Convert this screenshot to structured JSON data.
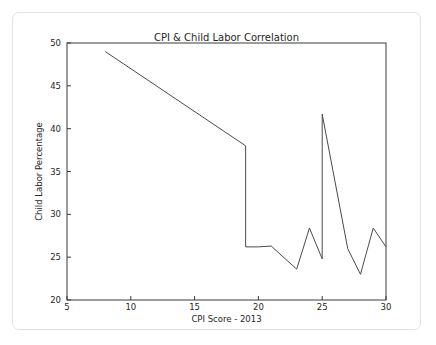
{
  "chart_data": {
    "type": "line",
    "title": "CPI & Child Labor Correlation",
    "xlabel": "CPI Score - 2013",
    "ylabel": "Child Labor Percentage",
    "xlim": [
      5,
      30
    ],
    "ylim": [
      20,
      50
    ],
    "xticks": [
      5,
      10,
      15,
      20,
      25,
      30
    ],
    "yticks": [
      20,
      25,
      30,
      35,
      40,
      45,
      50
    ],
    "xtick_labels": [
      "5",
      "10",
      "15",
      "20",
      "25",
      "30"
    ],
    "ytick_labels": [
      "20",
      "25",
      "30",
      "35",
      "40",
      "45",
      "50"
    ],
    "grid": false,
    "legend": null,
    "line_color": "#4b4b4b",
    "series": [
      {
        "name": "Child Labor Percentage",
        "x": [
          8,
          19,
          19,
          20,
          21,
          23,
          24,
          25,
          25,
          27,
          28,
          29,
          30
        ],
        "y": [
          49,
          38,
          26.2,
          26.2,
          26.3,
          23.6,
          28.4,
          24.8,
          41.7,
          26.0,
          23.0,
          28.4,
          26.2
        ]
      }
    ]
  },
  "figure": {
    "title": "CPI & Child Labor Correlation",
    "x_axis_title": "CPI Score - 2013",
    "y_axis_title": "Child Labor Percentage"
  }
}
